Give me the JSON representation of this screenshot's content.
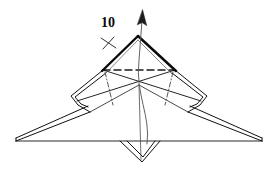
{
  "figure": {
    "kind": "origami-fold-diagram",
    "title_label": "10",
    "label_position": {
      "x": 101,
      "y": 16
    },
    "canvas": {
      "width": 276,
      "height": 174
    },
    "colors": {
      "paper_outline": "#111111",
      "bold_edge": "#0a0a0a",
      "thin_edge": "#2b2b2b",
      "crease_dashed": "#1a1a1a",
      "crease_dash_dot": "#3a3a3a",
      "arrow": "#4a4a4a",
      "background": "#ffffff"
    },
    "stroke_widths": {
      "bold_edge": 2.3,
      "outline": 1.0,
      "thin": 0.8,
      "crease": 0.9,
      "arrow": 0.9
    }
  },
  "geometry": {
    "top_kite": {
      "name": "top-kite-apex-triangle",
      "apex": {
        "x": 138,
        "y": 37
      },
      "left_corner": {
        "x": 103,
        "y": 70
      },
      "right_corner": {
        "x": 175,
        "y": 70
      },
      "bold_left_edge": "M103,70 L138,37",
      "bold_right_edge": "M138,37 L175,70"
    },
    "dashed_crease": {
      "name": "horizontal-valley-crease",
      "from": {
        "x": 103,
        "y": 70
      },
      "to": {
        "x": 175,
        "y": 70
      },
      "style": "dashed"
    },
    "x_crossing": {
      "name": "x-crossing-creases",
      "line_a": {
        "from": {
          "x": 103,
          "y": 70
        },
        "to": {
          "x": 201,
          "y": 101
        }
      },
      "line_b": {
        "from": {
          "x": 175,
          "y": 70
        },
        "to": {
          "x": 77,
          "y": 101
        }
      },
      "intersection": {
        "x": 139,
        "y": 85
      }
    },
    "left_flap": {
      "name": "left-side-flap",
      "outline": "M103,70 L72,96 L78,104 L90,112 L139,85 Z",
      "dash_dot_crease": {
        "from": {
          "x": 104,
          "y": 72
        },
        "to": {
          "x": 112,
          "y": 104
        }
      }
    },
    "right_flap": {
      "name": "right-side-flap",
      "outline": "M175,70 L206,96 L200,104 L188,112 L139,85 Z",
      "dash_dot_crease": {
        "from": {
          "x": 174,
          "y": 72
        },
        "to": {
          "x": 166,
          "y": 104
        }
      }
    },
    "left_wing": {
      "name": "left-wing",
      "tip": {
        "x": 16,
        "y": 141
      },
      "outline": "M90,112 L16,141 L16,138 L88,107 Z"
    },
    "right_wing": {
      "name": "right-wing",
      "tip": {
        "x": 262,
        "y": 141
      },
      "outline": "M188,112 L262,141 L262,138 L190,107 Z"
    },
    "baseline": {
      "name": "horizontal-baseline",
      "from": {
        "x": 16,
        "y": 141
      },
      "to": {
        "x": 262,
        "y": 141
      }
    },
    "bottom_point": {
      "name": "bottom-v-point",
      "outline": "M120,141 L142,162 L160,141 L155,141 L142,157 L125,141 Z"
    },
    "center_vertical": {
      "name": "center-vertical-line",
      "from": {
        "x": 139,
        "y": 85
      },
      "to": {
        "x": 142,
        "y": 160
      }
    },
    "fold_arrow": {
      "name": "fold-direction-arrow",
      "path": "M147,143 C150,115 136,92 140,58 L143,20",
      "head": {
        "x": 143,
        "y": 11
      },
      "direction": "up",
      "style": "curved-with-solid-head"
    },
    "tick_mark": {
      "name": "edge-tick-mark",
      "center": {
        "x": 108,
        "y": 42
      },
      "stroke_a": {
        "from": {
          "x": 102,
          "y": 38
        },
        "to": {
          "x": 115,
          "y": 47
        }
      },
      "stroke_b": {
        "from": {
          "x": 114,
          "y": 37
        },
        "to": {
          "x": 103,
          "y": 48
        }
      }
    }
  }
}
